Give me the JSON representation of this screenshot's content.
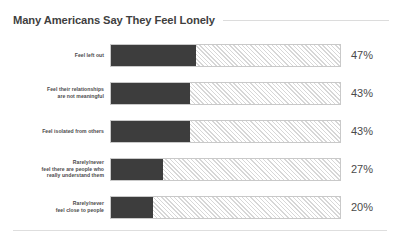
{
  "chart_data": {
    "type": "bar",
    "title": "Many Americans Say They Feel Lonely",
    "orientation": "horizontal",
    "xlabel": "",
    "ylabel": "",
    "grid": false,
    "legend": null,
    "xlim": [
      0,
      100
    ],
    "track_scale_max": 100,
    "value_suffix": "%",
    "categories": [
      "Feel left out",
      "Feel their relationships\nare not meaningful",
      "Feel isolated from others",
      "Rarely/never\nfeel there are people who\nreally understand them",
      "Rarely/never\nfeel close to people"
    ],
    "values": [
      47,
      43,
      43,
      27,
      20
    ],
    "value_labels": [
      "47%",
      "43%",
      "43%",
      "27%",
      "20%"
    ],
    "bar_fill_color": "#3d3d3d",
    "bar_track_hatch_color": "#d7d7d7",
    "bar_track_border_color": "#c9c9c9",
    "fill_fractions": [
      0.372,
      0.346,
      0.346,
      0.229,
      0.182
    ]
  },
  "colors": {
    "title_text": "#3f3f3f",
    "label_text": "#4a4a4a",
    "value_text": "#4a4a4a",
    "rule": "#dcdcdc",
    "background": "#ffffff"
  }
}
